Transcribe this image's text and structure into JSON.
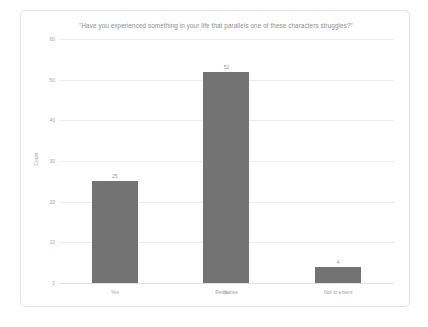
{
  "chart_data": {
    "type": "bar",
    "title": "\"Have you experienced something in your life that parallels one of these characters struggles?\"",
    "xlabel": "Response",
    "ylabel": "Count",
    "categories": [
      "Yes",
      "No",
      "Not to extent"
    ],
    "values": [
      25,
      52,
      4
    ],
    "value_labels": [
      "25",
      "52",
      "4"
    ],
    "yticks": [
      0,
      10,
      20,
      30,
      40,
      50,
      60
    ],
    "ytick_labels": [
      "0",
      "10",
      "20",
      "30",
      "40",
      "50",
      "60"
    ],
    "ylim": [
      0,
      60
    ],
    "grid": true,
    "legend": false,
    "series_color": "#737373",
    "gridline_color": "#ededed",
    "text_color": "#a3a3a3"
  }
}
